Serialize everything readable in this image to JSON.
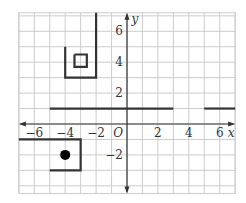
{
  "graph": {
    "x_range": [
      -7,
      7
    ],
    "y_range": [
      -4.5,
      7.2
    ],
    "x_axis_label": "x",
    "y_axis_label": "y",
    "origin_label": "O",
    "x_ticks": [
      {
        "value": -6,
        "label": "−6"
      },
      {
        "value": -4,
        "label": "−4"
      },
      {
        "value": -2,
        "label": "−2"
      },
      {
        "value": 2,
        "label": "2"
      },
      {
        "value": 4,
        "label": "4"
      },
      {
        "value": 6,
        "label": "6"
      }
    ],
    "y_ticks": [
      {
        "value": 6,
        "label": "6"
      },
      {
        "value": 4,
        "label": "4"
      },
      {
        "value": 2,
        "label": "2"
      },
      {
        "value": -2,
        "label": "−2"
      }
    ],
    "colors": {
      "grid": "#cccccc",
      "axis": "#333333",
      "shape": "#333333"
    },
    "shapes": [
      {
        "name": "u-shaped-path",
        "points": [
          [
            -4,
            5
          ],
          [
            -4,
            3
          ],
          [
            -2,
            3
          ],
          [
            -2,
            7.2
          ]
        ]
      },
      {
        "name": "small-square",
        "points": [
          [
            -3.4,
            4.5
          ],
          [
            -2.6,
            4.5
          ],
          [
            -2.6,
            3.7
          ],
          [
            -3.4,
            3.7
          ],
          [
            -3.4,
            4.5
          ]
        ]
      },
      {
        "name": "horizontal-line-left",
        "points": [
          [
            -5,
            1
          ],
          [
            3,
            1
          ]
        ]
      },
      {
        "name": "horizontal-line-right",
        "points": [
          [
            5,
            1
          ],
          [
            7,
            1
          ]
        ]
      },
      {
        "name": "bottom-box-path",
        "points": [
          [
            -7,
            -1
          ],
          [
            -3,
            -1
          ],
          [
            -3,
            -3
          ],
          [
            -5,
            -3
          ]
        ]
      }
    ],
    "points": [
      {
        "name": "filled-dot",
        "x": -4,
        "y": -2
      }
    ]
  }
}
